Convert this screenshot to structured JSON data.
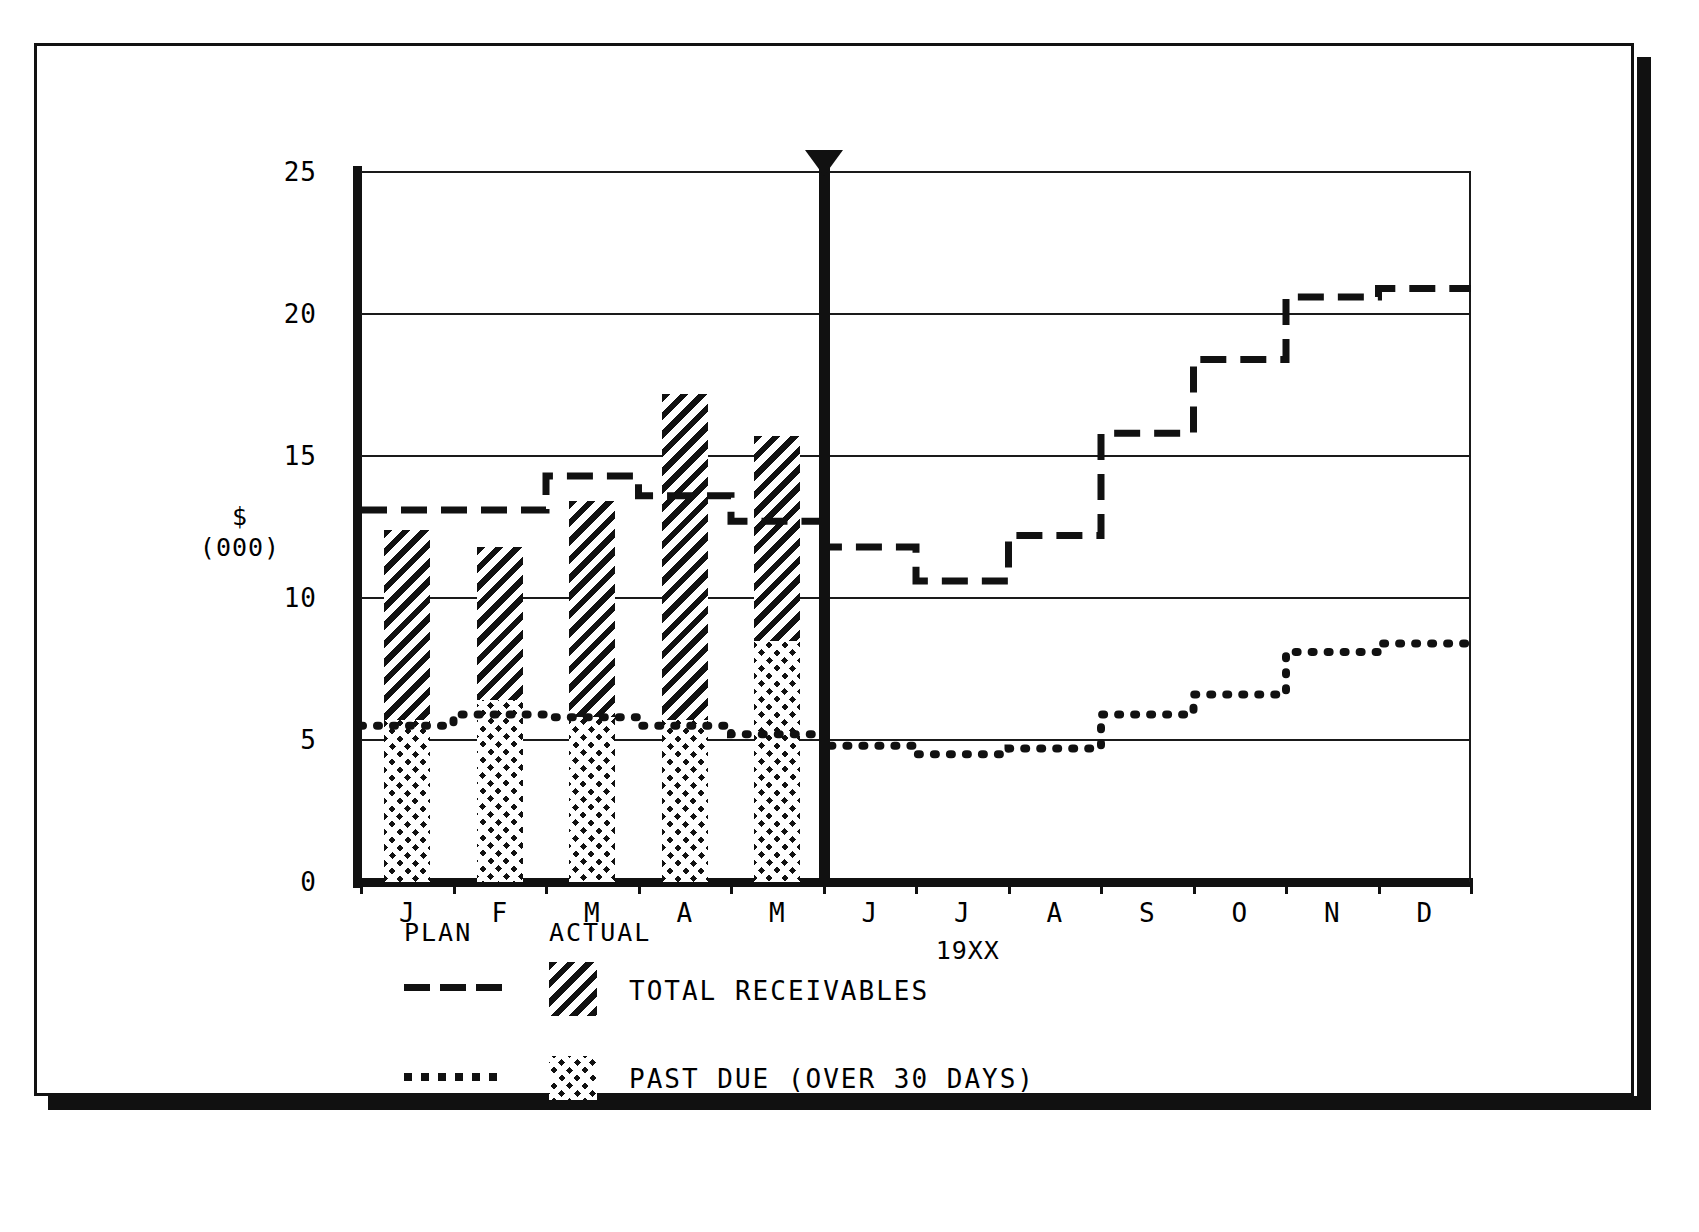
{
  "chart_data": {
    "type": "bar",
    "title": "",
    "xlabel": "19XX",
    "ylabel": "$ (000)",
    "ylabel_currency": "$",
    "ylabel_units": "(000)",
    "ylim": [
      0,
      25
    ],
    "ytick_values": [
      0,
      5,
      10,
      15,
      20,
      25
    ],
    "ytick_labels": [
      "0",
      "5",
      "10",
      "15",
      "20",
      "25"
    ],
    "grid": true,
    "grid_axis": "y",
    "categories": [
      "J",
      "F",
      "M",
      "A",
      "M",
      "J",
      "J",
      "A",
      "S",
      "O",
      "N",
      "D"
    ],
    "category_names": [
      "January",
      "February",
      "March",
      "April",
      "May",
      "June",
      "July",
      "August",
      "September",
      "October",
      "November",
      "December"
    ],
    "today_marker": {
      "label": "current-period-marker",
      "after_category": "M",
      "index": 5
    },
    "series": [
      {
        "name": "TOTAL RECEIVABLES",
        "kind": "bar",
        "style": "diagonal-hatch",
        "scope": "ACTUAL",
        "values": [
          12.4,
          11.8,
          13.4,
          17.2,
          15.7,
          null,
          null,
          null,
          null,
          null,
          null,
          null
        ]
      },
      {
        "name": "PAST DUE (OVER 30 DAYS)",
        "kind": "bar",
        "style": "cross-hatch",
        "scope": "ACTUAL",
        "values": [
          5.7,
          6.4,
          5.8,
          5.7,
          8.5,
          null,
          null,
          null,
          null,
          null,
          null,
          null
        ]
      },
      {
        "name": "TOTAL RECEIVABLES",
        "kind": "step",
        "style": "dashed",
        "scope": "PLAN",
        "values": [
          13.1,
          13.1,
          14.3,
          13.6,
          12.7,
          11.8,
          10.6,
          12.2,
          15.8,
          18.4,
          20.6,
          20.9
        ]
      },
      {
        "name": "PAST DUE (OVER 30 DAYS)",
        "kind": "step",
        "style": "dotted",
        "scope": "PLAN",
        "values": [
          5.5,
          5.9,
          5.8,
          5.5,
          5.2,
          4.8,
          4.5,
          4.7,
          5.9,
          6.6,
          8.1,
          8.4
        ]
      }
    ],
    "legend": {
      "position": "below-axis",
      "col_headers": [
        "PLAN",
        "ACTUAL"
      ],
      "entries": [
        {
          "label": "TOTAL RECEIVABLES",
          "plan_style": "dashed-line",
          "actual_style": "diagonal-hatch-swatch"
        },
        {
          "label": "PAST DUE (OVER 30 DAYS)",
          "plan_style": "dotted-line",
          "actual_style": "cross-hatch-swatch"
        }
      ]
    },
    "colors": {
      "ink": "#111111",
      "paper": "#ffffff"
    }
  }
}
